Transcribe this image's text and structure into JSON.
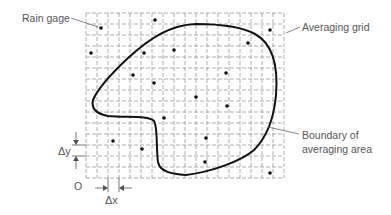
{
  "figure": {
    "labels": {
      "rain_gage": "Rain gage",
      "averaging_grid": "Averaging grid",
      "boundary_line1": "Boundary of",
      "boundary_line2": "averaging area",
      "delta_y": "Δy",
      "delta_x": "Δx",
      "origin": "O"
    },
    "grid": {
      "x0": 86,
      "y0": 13,
      "cell": 11,
      "columns": 18,
      "rows": 15,
      "color": "#9a9a9a"
    },
    "boundary_color": "#111111",
    "rain_gages": [
      {
        "x": 101,
        "y": 28
      },
      {
        "x": 155,
        "y": 20
      },
      {
        "x": 270,
        "y": 30
      },
      {
        "x": 248,
        "y": 43
      },
      {
        "x": 91,
        "y": 53
      },
      {
        "x": 144,
        "y": 53
      },
      {
        "x": 174,
        "y": 50
      },
      {
        "x": 133,
        "y": 75
      },
      {
        "x": 154,
        "y": 83
      },
      {
        "x": 226,
        "y": 73
      },
      {
        "x": 196,
        "y": 97
      },
      {
        "x": 227,
        "y": 106
      },
      {
        "x": 164,
        "y": 118
      },
      {
        "x": 113,
        "y": 141
      },
      {
        "x": 142,
        "y": 149
      },
      {
        "x": 206,
        "y": 138
      },
      {
        "x": 205,
        "y": 162
      },
      {
        "x": 270,
        "y": 173
      }
    ]
  }
}
